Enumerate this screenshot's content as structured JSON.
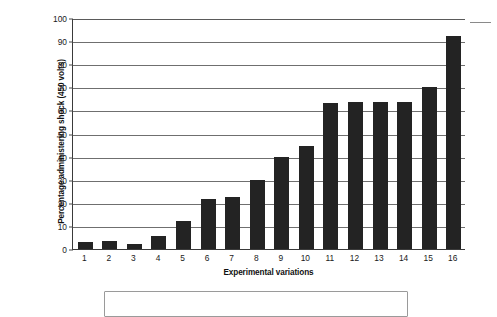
{
  "chart_data": {
    "type": "bar",
    "title": "",
    "xlabel": "Experimental variations",
    "ylabel": "Percentage administering shock (450 volts)",
    "categories": [
      "1",
      "2",
      "3",
      "4",
      "5",
      "6",
      "7",
      "8",
      "9",
      "10",
      "11",
      "12",
      "13",
      "14",
      "15",
      "16"
    ],
    "values": [
      3,
      3.5,
      2,
      5.5,
      12,
      21.5,
      22.5,
      30,
      40,
      44.5,
      63,
      63.5,
      63.5,
      63.5,
      70,
      92
    ],
    "ylim": [
      0,
      100
    ],
    "ytick_labels": [
      "0",
      "10",
      "20",
      "30",
      "40",
      "50",
      "60",
      "70",
      "80",
      "90",
      "100"
    ],
    "ytick_values": [
      0,
      10,
      20,
      30,
      40,
      50,
      60,
      70,
      80,
      90,
      100
    ],
    "grid": true,
    "legend": null,
    "legend_position": "none",
    "bar_color": "#232323",
    "gridline_color": "#6f6f6f",
    "axis_color": "#3a3a3a"
  },
  "figure": {
    "y_axis_title": "Percentage administering shock (450 volts)",
    "x_axis_title": "Experimental variations"
  }
}
